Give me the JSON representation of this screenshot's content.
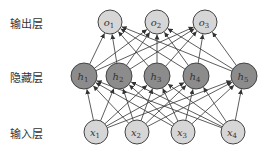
{
  "labels": {
    "output": "输出层",
    "hidden": "隐藏层",
    "input": "输入层"
  },
  "colors": {
    "output_fill": "#d6d6d6",
    "hidden_fill": "#8c8c8c",
    "input_fill": "#d6d6d6",
    "stroke": "#444444",
    "edge": "#333333"
  },
  "nodes": {
    "output": [
      {
        "base": "o",
        "sub": "1",
        "cx": 110,
        "cy": 22
      },
      {
        "base": "o",
        "sub": "2",
        "cx": 157,
        "cy": 22
      },
      {
        "base": "o",
        "sub": "3",
        "cx": 205,
        "cy": 22
      }
    ],
    "hidden": [
      {
        "base": "h",
        "sub": "1",
        "cx": 84,
        "cy": 76
      },
      {
        "base": "h",
        "sub": "2",
        "cx": 119,
        "cy": 76
      },
      {
        "base": "h",
        "sub": "3",
        "cx": 157,
        "cy": 76
      },
      {
        "base": "h",
        "sub": "4",
        "cx": 196,
        "cy": 76
      },
      {
        "base": "h",
        "sub": "5",
        "cx": 244,
        "cy": 76
      }
    ],
    "input": [
      {
        "base": "x",
        "sub": "1",
        "cx": 96,
        "cy": 132
      },
      {
        "base": "x",
        "sub": "2",
        "cx": 137,
        "cy": 132
      },
      {
        "base": "x",
        "sub": "3",
        "cx": 183,
        "cy": 132
      },
      {
        "base": "x",
        "sub": "4",
        "cx": 233,
        "cy": 132
      }
    ]
  },
  "radius": {
    "output": 12,
    "hidden": 13,
    "input": 12
  }
}
